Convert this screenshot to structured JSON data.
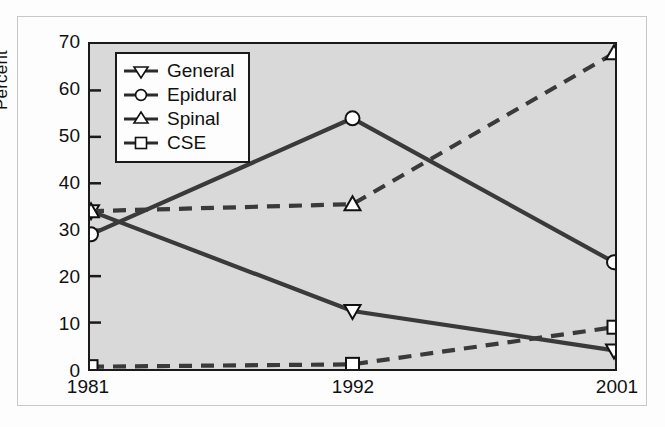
{
  "figure": {
    "background_color": "#fdfdfd",
    "frame_color": "#c8c8c8",
    "plot_fill_color": "#d9d9d9",
    "axis_color": "#1a1a1a",
    "series_color": "#3a3a3a"
  },
  "chart_data": {
    "type": "line",
    "title": "",
    "subtitle": "",
    "xlabel": "",
    "ylabel": "Percent",
    "categories": [
      "1981",
      "1992",
      "2001"
    ],
    "x": [
      1981,
      1992,
      2001
    ],
    "ylim": [
      0,
      70
    ],
    "yticks": [
      0,
      10,
      20,
      30,
      40,
      50,
      60,
      70
    ],
    "ytick_labels": [
      "0",
      "10",
      "20",
      "30",
      "40",
      "50",
      "60",
      "70"
    ],
    "xtick_labels": [
      "1981",
      "1992",
      "2001"
    ],
    "grid": false,
    "legend_position": "upper-left-inside",
    "series": [
      {
        "name": "General",
        "marker": "triangle-down",
        "linestyle": "solid",
        "color": "#3a3a3a",
        "values": [
          34,
          12.5,
          4
        ]
      },
      {
        "name": "Epidural",
        "marker": "circle",
        "linestyle": "solid",
        "color": "#3a3a3a",
        "values": [
          29,
          54,
          23
        ]
      },
      {
        "name": "Spinal",
        "marker": "triangle-up",
        "linestyle": "dashed",
        "color": "#3a3a3a",
        "values": [
          34,
          35.5,
          68
        ]
      },
      {
        "name": "CSE",
        "marker": "square",
        "linestyle": "dashed",
        "color": "#3a3a3a",
        "values": [
          0.5,
          1,
          9
        ]
      }
    ]
  },
  "legend": {
    "items": [
      {
        "label": "General",
        "marker": "triangle-down-marker-icon"
      },
      {
        "label": "Epidural",
        "marker": "circle-marker-icon"
      },
      {
        "label": "Spinal",
        "marker": "triangle-up-marker-icon"
      },
      {
        "label": "CSE",
        "marker": "square-marker-icon"
      }
    ]
  }
}
